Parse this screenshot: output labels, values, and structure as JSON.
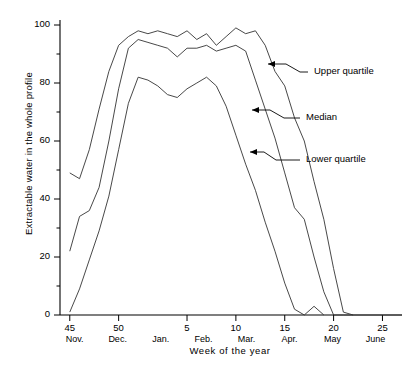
{
  "chart_data": {
    "type": "line",
    "title": "",
    "xlabel": "Week of the year",
    "ylabel": "Extractable water in the whole profile",
    "xlim": [
      44,
      27
    ],
    "ylim": [
      0,
      100
    ],
    "grid": false,
    "legend_position": "inline-annotations",
    "x_tick_labels": [
      "45",
      "50",
      "5",
      "10",
      "15",
      "20",
      "25"
    ],
    "x_tick_weeks": [
      45,
      50,
      5,
      10,
      15,
      20,
      25
    ],
    "x_month_labels": [
      "Nov.",
      "Dec.",
      "Jan.",
      "Feb.",
      "Mar.",
      "Apr.",
      "May",
      "June"
    ],
    "y_tick_labels": [
      "0",
      "20",
      "40",
      "60",
      "80",
      "100"
    ],
    "y_ticks": [
      0,
      20,
      40,
      60,
      80,
      100
    ],
    "y_minor_step": 10,
    "annotations": [
      {
        "label": "Upper quartile",
        "target_series": "Upper quartile"
      },
      {
        "label": "Median",
        "target_series": "Median"
      },
      {
        "label": "Lower quartile",
        "target_series": "Lower quartile"
      }
    ],
    "series": [
      {
        "name": "Upper quartile",
        "color": "#333333",
        "x": [
          45,
          46,
          47,
          48,
          49,
          50,
          51,
          52,
          1,
          2,
          3,
          4,
          5,
          6,
          7,
          8,
          9,
          10,
          11,
          12,
          13,
          14,
          15,
          16,
          17,
          18,
          19,
          20,
          21,
          22
        ],
        "values": [
          49,
          47,
          57,
          71,
          84,
          93,
          96,
          98,
          97,
          98,
          97,
          96,
          98,
          95,
          97,
          93,
          96,
          99,
          97,
          98,
          93,
          84,
          79,
          68,
          60,
          46,
          33,
          16,
          1,
          0
        ]
      },
      {
        "name": "Median",
        "color": "#333333",
        "x": [
          45,
          46,
          47,
          48,
          49,
          50,
          51,
          52,
          1,
          2,
          3,
          4,
          5,
          6,
          7,
          8,
          9,
          10,
          11,
          12,
          13,
          14,
          15,
          16,
          17,
          18,
          19,
          20,
          21
        ],
        "values": [
          22,
          34,
          36,
          44,
          60,
          78,
          92,
          95,
          94,
          93,
          92,
          89,
          92,
          92,
          93,
          91,
          92,
          93,
          91,
          81,
          71,
          61,
          49,
          37,
          33,
          20,
          8,
          0,
          0
        ]
      },
      {
        "name": "Lower quartile",
        "color": "#333333",
        "x": [
          45,
          46,
          47,
          48,
          49,
          50,
          51,
          52,
          1,
          2,
          3,
          4,
          5,
          6,
          7,
          8,
          9,
          10,
          11,
          12,
          13,
          14,
          15,
          16,
          17,
          18,
          19
        ],
        "values": [
          1,
          9,
          19,
          29,
          41,
          57,
          73,
          82,
          81,
          79,
          76,
          75,
          78,
          80,
          82,
          79,
          72,
          62,
          52,
          43,
          32,
          22,
          11,
          2,
          0,
          3,
          0
        ]
      }
    ]
  }
}
